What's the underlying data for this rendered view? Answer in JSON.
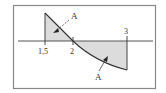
{
  "figure": {
    "type": "area-between-curve-and-axis",
    "frame_color": "#777777",
    "shade_color": "#d9d9d9",
    "curve_color": "#333333"
  },
  "axis": {
    "ticks": [
      {
        "value": 1.5,
        "label": "1,5"
      },
      {
        "value": 2,
        "label": "2"
      },
      {
        "value": 3,
        "label": "3"
      }
    ]
  },
  "regions": [
    {
      "label": "A",
      "position": "above-axis",
      "x_range": [
        1.5,
        2
      ]
    },
    {
      "label": "A",
      "position": "below-axis",
      "x_range": [
        2,
        3
      ]
    }
  ],
  "labels": {
    "region_upper": "A",
    "region_lower": "A",
    "tick_1": "1,5",
    "tick_2": "2",
    "tick_3": "3"
  }
}
